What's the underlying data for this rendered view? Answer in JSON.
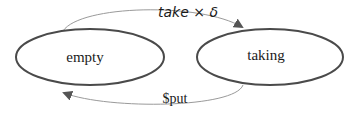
{
  "diagram": {
    "type": "state-transition",
    "states": [
      {
        "id": "empty",
        "label": "empty"
      },
      {
        "id": "taking",
        "label": "taking"
      }
    ],
    "transitions": [
      {
        "from": "empty",
        "to": "taking",
        "label": "take × δ"
      },
      {
        "from": "taking",
        "to": "empty",
        "label": "$put"
      }
    ],
    "colors": {
      "state_stroke": "#4a4a4a",
      "edge_stroke": "#9a9a9a",
      "arrowhead": "#555555",
      "text": "#1a1a1a"
    }
  }
}
